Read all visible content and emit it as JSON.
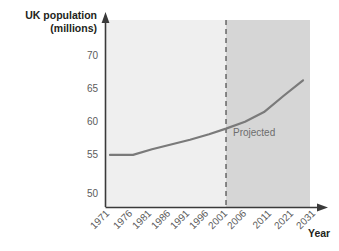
{
  "chart_data": {
    "type": "line",
    "title": "",
    "ylabel_line1": "UK population",
    "ylabel_line2": "(millions)",
    "xlabel": "Year",
    "x": [
      "1971",
      "1976",
      "1981",
      "1986",
      "1991",
      "1996",
      "2001",
      "2006",
      "2011",
      "2021",
      "2031"
    ],
    "categories": [
      "1971",
      "1976",
      "1981",
      "1986",
      "1991",
      "1996",
      "2001",
      "2006",
      "2011",
      "2021",
      "2031"
    ],
    "values": [
      55.6,
      55.6,
      56.4,
      57.1,
      57.8,
      58.6,
      59.4,
      60.4,
      61.8,
      64.2,
      66.4
    ],
    "series": [
      {
        "name": "UK population",
        "values": [
          55.6,
          55.6,
          56.4,
          57.1,
          57.8,
          58.6,
          59.4,
          60.4,
          61.8,
          64.2,
          66.4
        ]
      }
    ],
    "ytick_labels": [
      "70",
      "65",
      "60",
      "55",
      "50"
    ],
    "yticks": [
      70,
      65,
      60,
      55,
      50
    ],
    "ylim": [
      48.2,
      71.5
    ],
    "grid": false,
    "legend": "none",
    "annotations": [
      {
        "text": "Projected",
        "at_x": "2011",
        "at_y": 59.0
      }
    ],
    "divider": {
      "at_x": "2006",
      "style": "dashed",
      "label": "Projected"
    },
    "line_color": "#7a7a7a",
    "region_historical_color": "#efefef",
    "region_projected_color": "#d6d6d6",
    "axis_color": "#3a3a3a"
  },
  "annotations": {
    "projected": "Projected"
  },
  "axes": {
    "y_title_line1": "UK population",
    "y_title_line2": "(millions)",
    "x_title": "Year"
  },
  "yticks": {
    "t0": "70",
    "t1": "65",
    "t2": "60",
    "t3": "55",
    "t4": "50"
  },
  "xticks": {
    "t0": "1971",
    "t1": "1976",
    "t2": "1981",
    "t3": "1986",
    "t4": "1991",
    "t5": "1996",
    "t6": "2001",
    "t7": "2006",
    "t8": "2011",
    "t9": "2021",
    "t10": "2031"
  }
}
